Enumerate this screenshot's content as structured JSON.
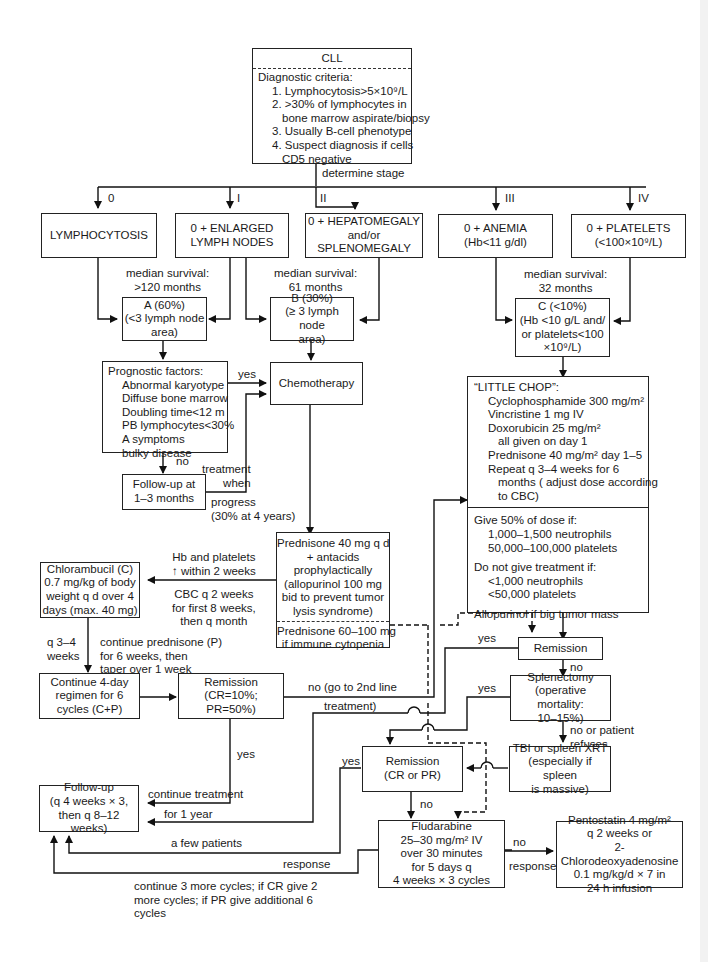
{
  "diagram": {
    "title": "CLL",
    "diagnostic_criteria": {
      "heading": "Diagnostic criteria:",
      "items": [
        "1. Lymphocytosis>5×10⁹/L",
        "2. >30% of lymphocytes in",
        "bone marrow aspirate/biopsy",
        "3. Usually B-cell phenotype",
        "4. Suspect diagnosis if cells",
        "CD5 negative"
      ]
    },
    "determine_stage_label": "determine stage",
    "stages": [
      {
        "roman": "0",
        "lines": [
          "LYMPHOCYTOSIS"
        ]
      },
      {
        "roman": "I",
        "lines": [
          "0 + ENLARGED",
          "LYMPH NODES"
        ]
      },
      {
        "roman": "II",
        "lines": [
          "0 + HEPATOMEGALY",
          "and/or",
          "SPLENOMEGALY"
        ]
      },
      {
        "roman": "III",
        "lines": [
          "0 + ANEMIA",
          "(Hb<11 g/dl)"
        ]
      },
      {
        "roman": "IV",
        "lines": [
          "0 + PLATELETS",
          "(<100×10⁹/L)"
        ]
      }
    ],
    "survival": [
      {
        "lines": [
          "median survival:",
          ">120 months"
        ]
      },
      {
        "lines": [
          "median survival:",
          "61 months"
        ]
      },
      {
        "lines": [
          "median survival:",
          "32 months"
        ]
      }
    ],
    "groups": {
      "A": [
        "A (60%)",
        "(<3 lymph node",
        "area)"
      ],
      "B": [
        "B (30%)",
        "(≥ 3 lymph node",
        "area)"
      ],
      "C": [
        "C (<10%)",
        "(Hb <10 g/L and/",
        "or platelets<100",
        "×10⁹/L)"
      ]
    },
    "prognostic_factors": {
      "heading": "Prognostic factors:",
      "items": [
        "Abnormal karyotype",
        "Diffuse bone marrow",
        "Doubling time<12 m",
        "PB lymphocytes<30%",
        "A symptoms",
        "bulky disease"
      ]
    },
    "chemotherapy": "Chemotherapy",
    "follow_up_short": [
      "Follow-up at",
      "1–3 months"
    ],
    "edge_labels": {
      "yes1": "yes",
      "no1": "no",
      "treatment_when": [
        "treatment",
        "when"
      ],
      "progress": [
        "progress",
        "(30% at 4 years)"
      ],
      "hb_platelets": [
        "Hb and platelets",
        "↑ within 2 weeks"
      ],
      "cbc": [
        "CBC q 2 weeks",
        "for first 8 weeks,",
        "then q month"
      ],
      "q34": [
        "q 3–4",
        "weeks"
      ],
      "continue_pred": [
        "continue prednisone (P)",
        "for 6 weeks, then",
        "taper over 1 week"
      ],
      "no_second_line": [
        "no (go to 2nd line",
        "treatment)"
      ],
      "yes_remission_c": "yes",
      "yes_remission_main": "yes",
      "continue_treatment": [
        "continue treatment",
        "for 1 year"
      ],
      "yes_splen": "yes",
      "no_splen": "no",
      "no_or_refuses": [
        "no or patient",
        "refuses"
      ],
      "yes_cr_pr": "yes",
      "no_cr_pr": "no",
      "a_few_patients": "a few patients",
      "response": "response",
      "continue_cycles": [
        "continue 3 more cycles; if CR give 2",
        "more cycles; if PR give additional 6",
        "cycles"
      ],
      "no_response": [
        "no",
        "response"
      ]
    },
    "prednisone_box": {
      "main": [
        "Prednisone 40 mg q d",
        "+ antacids",
        "prophylactically",
        "(allopurinol 100 mg",
        "bid to prevent tumor",
        "lysis syndrome)"
      ],
      "alt": [
        "Prednisone 60–100 mg",
        "if immune cytopenia"
      ]
    },
    "chlorambucil": [
      "Chlorambucil (C)",
      "0.7 mg/kg of body",
      "weight q d over 4",
      "days (max. 40 mg)"
    ],
    "continue_regimen": [
      "Continue 4-day",
      "regimen for 6",
      "cycles (C+P)"
    ],
    "remission_c": [
      "Remission",
      "(CR=10%; PR=50%)"
    ],
    "little_chop": {
      "heading": "“LITTLE CHOP”:",
      "items": [
        "Cyclophosphamide 300 mg/m²",
        "Vincristine 1 mg IV",
        "Doxorubicin 25 mg/m²"
      ],
      "sub": "all given on day 1",
      "items2": [
        "Prednisone 40 mg/m² day 1–5",
        "Repeat q 3–4 weeks for 6"
      ],
      "sub2": [
        "months ( adjust dose according",
        "to CBC)"
      ],
      "dose50_heading": "Give 50% of dose if:",
      "dose50_items": [
        "1,000–1,500 neutrophils",
        "50,000–100,000 platelets"
      ],
      "no_treat_heading": "Do not give treatment if:",
      "no_treat_items": [
        "<1,000 neutrophils",
        "<50,000 platelets"
      ],
      "allopurinol": "Allopurinol if big tumor mass"
    },
    "remission_main": "Remission",
    "splenectomy": [
      "Splenectomy",
      "(operative mortality:",
      "10–15%)"
    ],
    "tbi": [
      "TBI or spleen XRT",
      "(especially if spleen",
      "is massive)"
    ],
    "remission_cr_pr": [
      "Remission",
      "(CR or PR)"
    ],
    "follow_up_long": [
      "Follow-up",
      "(q 4 weeks × 3,",
      "then q 8–12 weeks)"
    ],
    "fludarabine": [
      "Fludarabine",
      "25–30 mg/m² IV",
      "over 30 minutes",
      "for 5 days q",
      "4 weeks × 3 cycles"
    ],
    "pentostatin": [
      "Pentostatin 4 mg/m²",
      "q 2 weeks or",
      "2-Chlorodeoxyadenosine",
      "0.1 mg/kg/d × 7 in",
      "24 h infusion"
    ]
  }
}
